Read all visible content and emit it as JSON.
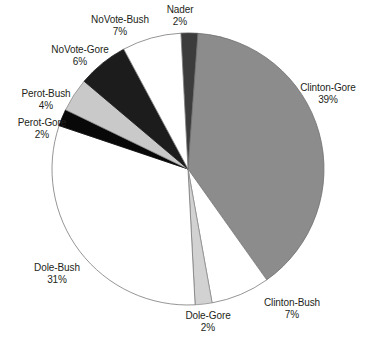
{
  "chart_data": {
    "type": "pie",
    "title": "",
    "subtitle": "",
    "xlabel": "",
    "ylabel": "",
    "legend_position": "none",
    "grid": false,
    "units": "percent",
    "total": 100,
    "labels_show_percent": true,
    "categories": [
      "Nader",
      "Clinton-Gore",
      "Clinton-Bush",
      "Dole-Gore",
      "Dole-Bush",
      "Perot-Gore",
      "Perot-Bush",
      "NoVote-Gore",
      "NoVote-Bush"
    ],
    "values": [
      2,
      39,
      7,
      2,
      31,
      2,
      4,
      6,
      7
    ],
    "slices": [
      {
        "name": "nader",
        "label": "Nader",
        "value": 2,
        "value_text": "2%",
        "color": "#3c3c3c",
        "stroke": "#4a4a4a"
      },
      {
        "name": "clinton-gore",
        "label": "Clinton-Gore",
        "value": 39,
        "value_text": "39%",
        "color": "#8c8c8c",
        "stroke": "#6e6e6e"
      },
      {
        "name": "clinton-bush",
        "label": "Clinton-Bush",
        "value": 7,
        "value_text": "7%",
        "color": "#ffffff",
        "stroke": "#7a7a7a"
      },
      {
        "name": "dole-gore",
        "label": "Dole-Gore",
        "value": 2,
        "value_text": "2%",
        "color": "#d2d2d2",
        "stroke": "#8e8e8e"
      },
      {
        "name": "dole-bush",
        "label": "Dole-Bush",
        "value": 31,
        "value_text": "31%",
        "color": "#ffffff",
        "stroke": "#7a7a7a"
      },
      {
        "name": "perot-gore",
        "label": "Perot-Gore",
        "value": 2,
        "value_text": "2%",
        "color": "#080808",
        "stroke": "#080808"
      },
      {
        "name": "perot-bush",
        "label": "Perot-Bush",
        "value": 4,
        "value_text": "4%",
        "color": "#c9c9c9",
        "stroke": "#8e8e8e"
      },
      {
        "name": "novote-gore",
        "label": "NoVote-Gore",
        "value": 6,
        "value_text": "6%",
        "color": "#1c1c1c",
        "stroke": "#1c1c1c"
      },
      {
        "name": "novote-bush",
        "label": "NoVote-Bush",
        "value": 7,
        "value_text": "7%",
        "color": "#ffffff",
        "stroke": "#7a7a7a"
      }
    ],
    "geometry": {
      "center_x": 188,
      "center_y": 169,
      "radius": 136,
      "start_angle_deg": -3
    }
  }
}
